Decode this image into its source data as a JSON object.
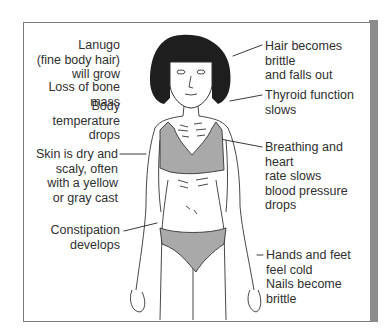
{
  "diagram": {
    "title": "",
    "figure": "emaciated-woman-in-underwear",
    "colors": {
      "underwear": "#a9a9a9",
      "hair": "#1e1e1e",
      "outline": "#333333",
      "frame_shadow": "#8c8c8c"
    },
    "labels_left": [
      {
        "id": "lanugo",
        "text": "Lanugo\n(fine body hair)\nwill grow"
      },
      {
        "id": "bone-mass",
        "text": "Loss of bone mass"
      },
      {
        "id": "body-temp",
        "text": "Body temperature\ndrops"
      },
      {
        "id": "skin",
        "text": "Skin is dry and\nscaly, often\nwith a yellow\nor gray cast"
      },
      {
        "id": "constipation",
        "text": "Constipation\ndevelops"
      }
    ],
    "labels_right": [
      {
        "id": "hair",
        "text": "Hair becomes brittle\nand falls out"
      },
      {
        "id": "thyroid",
        "text": "Thyroid function\nslows"
      },
      {
        "id": "breathing",
        "text": "Breathing and heart\nrate slows\nblood pressure\ndrops"
      },
      {
        "id": "hands-feet",
        "text": "Hands and feet\nfeel cold\nNails become brittle"
      }
    ]
  }
}
